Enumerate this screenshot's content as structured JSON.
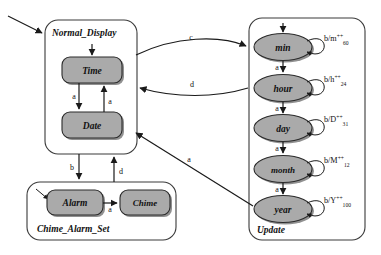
{
  "diagram": {
    "type": "statechart",
    "background_color": "#ffffff",
    "state_fill_color": "#aaaaaa",
    "state_stroke_color": "#2b2b2b",
    "superstate_stroke_color": "#3a3a3a",
    "edge_color": "#1a1a1a"
  },
  "superstates": [
    {
      "id": "normal_display",
      "label": "Normal_Display",
      "label_position": "top-left",
      "x": 45,
      "y": 20,
      "width": 92,
      "height": 134
    },
    {
      "id": "chime_alarm_set",
      "label": "Chime_Alarm_Set",
      "label_position": "bottom-left",
      "x": 27,
      "y": 182,
      "width": 149,
      "height": 58
    },
    {
      "id": "update",
      "label": "Update",
      "label_position": "bottom-left",
      "x": 249,
      "y": 18,
      "width": 116,
      "height": 222
    }
  ],
  "states": [
    {
      "id": "time",
      "label": "Time",
      "shape": "rounded-rect",
      "parent": "normal_display",
      "cx": 92,
      "cy": 70,
      "w": 60,
      "h": 26
    },
    {
      "id": "date",
      "label": "Date",
      "shape": "rounded-rect",
      "parent": "normal_display",
      "cx": 92,
      "cy": 125,
      "w": 60,
      "h": 26
    },
    {
      "id": "alarm",
      "label": "Alarm",
      "shape": "rounded-rect",
      "parent": "chime_alarm_set",
      "cx": 75,
      "cy": 203,
      "w": 56,
      "h": 26
    },
    {
      "id": "chime",
      "label": "Chime",
      "shape": "rounded-rect",
      "parent": "chime_alarm_set",
      "cx": 145,
      "cy": 203,
      "w": 50,
      "h": 26
    },
    {
      "id": "min",
      "label": "min",
      "shape": "ellipse",
      "parent": "update",
      "cx": 283,
      "cy": 47,
      "w": 58,
      "h": 27
    },
    {
      "id": "hour",
      "label": "hour",
      "shape": "ellipse",
      "parent": "update",
      "cx": 283,
      "cy": 88,
      "w": 58,
      "h": 27
    },
    {
      "id": "day",
      "label": "day",
      "shape": "ellipse",
      "parent": "update",
      "cx": 283,
      "cy": 128,
      "w": 58,
      "h": 27
    },
    {
      "id": "month",
      "label": "month",
      "shape": "ellipse",
      "parent": "update",
      "cx": 283,
      "cy": 169,
      "w": 58,
      "h": 27
    },
    {
      "id": "year",
      "label": "year",
      "shape": "ellipse",
      "parent": "update",
      "cx": 283,
      "cy": 209,
      "w": 58,
      "h": 27
    }
  ],
  "initial_transitions": [
    {
      "id": "init_normal_display",
      "target": "normal_display",
      "note": "incoming arrow from upper-left"
    },
    {
      "id": "init_time",
      "target": "time",
      "note": "vertical arrow into Time"
    },
    {
      "id": "init_min",
      "target": "min",
      "note": "vertical arrow into min"
    },
    {
      "id": "init_alarm",
      "target": "alarm",
      "note": "short diagonal arrow into Alarm"
    }
  ],
  "transitions": [
    {
      "id": "t_time_date",
      "label": "a",
      "from": "time",
      "to": "date",
      "label_x": 82,
      "label_y": 99
    },
    {
      "id": "t_date_time",
      "label": "a",
      "from": "date",
      "to": "time",
      "label_x": 103,
      "label_y": 102
    },
    {
      "id": "t_nd_update",
      "label": "c",
      "from": "normal_display",
      "to": "update",
      "label_x": 192,
      "label_y": 41
    },
    {
      "id": "t_update_nd",
      "label": "d",
      "from": "update",
      "to": "normal_display",
      "label_x": 192,
      "label_y": 85
    },
    {
      "id": "t_nd_cas",
      "label": "b",
      "from": "normal_display",
      "to": "chime_alarm_set",
      "label_x": 73,
      "label_y": 170
    },
    {
      "id": "t_cas_nd",
      "label": "d",
      "from": "chime_alarm_set",
      "to": "normal_display",
      "label_x": 118,
      "label_y": 172
    },
    {
      "id": "t_alarm_chime",
      "label": "a",
      "from": "alarm",
      "to": "chime",
      "label_x": 113,
      "label_y": 209
    },
    {
      "id": "t_year_nd",
      "label": "a",
      "from": "year",
      "to": "normal_display",
      "label_x": 188,
      "label_y": 160
    },
    {
      "id": "t_min_hour",
      "label": "a",
      "from": "min",
      "to": "hour",
      "label_x": 277,
      "label_y": 69
    },
    {
      "id": "t_hour_day",
      "label": "a",
      "from": "hour",
      "to": "day",
      "label_x": 277,
      "label_y": 110
    },
    {
      "id": "t_day_month",
      "label": "a",
      "from": "day",
      "to": "month",
      "label_x": 277,
      "label_y": 150
    },
    {
      "id": "t_month_year",
      "label": "a",
      "from": "month",
      "to": "year",
      "label_x": 277,
      "label_y": 191
    }
  ],
  "self_loops": [
    {
      "id": "loop_min",
      "state": "min",
      "base": "b/m",
      "sup": "++",
      "sub": "60",
      "label_x": 328,
      "label_y": 41
    },
    {
      "id": "loop_hour",
      "state": "hour",
      "base": "b/h",
      "sup": "++",
      "sub": "24",
      "label_x": 328,
      "label_y": 82
    },
    {
      "id": "loop_day",
      "state": "day",
      "base": "b/D",
      "sup": "++",
      "sub": "31",
      "label_x": 328,
      "label_y": 122
    },
    {
      "id": "loop_month",
      "state": "month",
      "base": "b/M",
      "sup": "++",
      "sub": "12",
      "label_x": 328,
      "label_y": 163
    },
    {
      "id": "loop_year",
      "state": "year",
      "base": "b/Y",
      "sup": "++",
      "sub": "100",
      "label_x": 328,
      "label_y": 203
    }
  ]
}
